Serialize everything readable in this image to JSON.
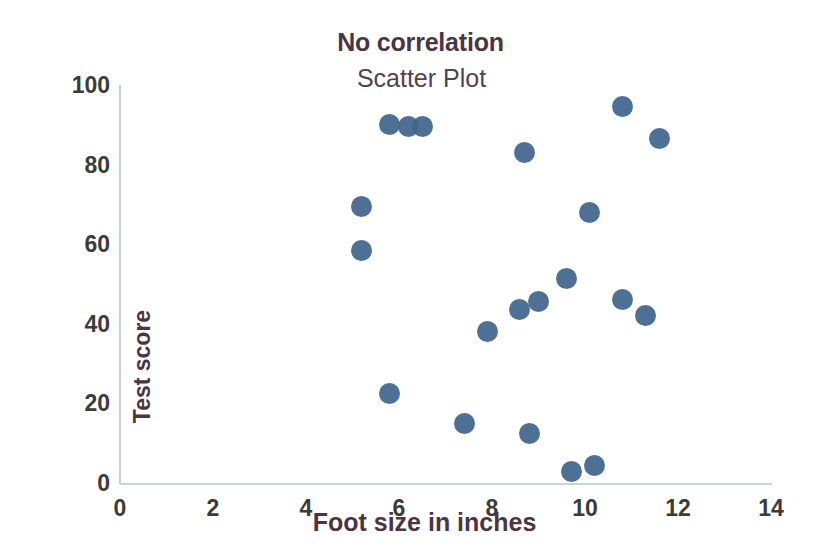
{
  "chart_data": {
    "type": "scatter",
    "title": "No correlation",
    "subtitle": "Scatter Plot",
    "xlabel": "Foot size in inches",
    "ylabel": "Test score",
    "xlim": [
      0,
      14
    ],
    "ylim": [
      0,
      100
    ],
    "xticks": [
      0,
      2,
      4,
      6,
      8,
      10,
      12,
      14
    ],
    "yticks": [
      0,
      20,
      40,
      60,
      80,
      100
    ],
    "grid": false,
    "legend": false,
    "marker_color": "#41658c",
    "title_color": "#4a3544",
    "axis_color": "#c9cdd4",
    "series": [
      {
        "name": "Test score vs foot size",
        "points": [
          {
            "x": 5.2,
            "y": 69.5
          },
          {
            "x": 5.2,
            "y": 58.5
          },
          {
            "x": 5.8,
            "y": 22.5
          },
          {
            "x": 5.8,
            "y": 90.0
          },
          {
            "x": 6.2,
            "y": 89.5
          },
          {
            "x": 6.5,
            "y": 89.5
          },
          {
            "x": 7.4,
            "y": 15.0
          },
          {
            "x": 7.9,
            "y": 38.0
          },
          {
            "x": 8.6,
            "y": 43.5
          },
          {
            "x": 8.7,
            "y": 83.0
          },
          {
            "x": 8.8,
            "y": 12.5
          },
          {
            "x": 9.0,
            "y": 45.5
          },
          {
            "x": 9.6,
            "y": 51.5
          },
          {
            "x": 9.7,
            "y": 3.0
          },
          {
            "x": 10.1,
            "y": 68.0
          },
          {
            "x": 10.2,
            "y": 4.5
          },
          {
            "x": 10.8,
            "y": 94.5
          },
          {
            "x": 10.8,
            "y": 46.0
          },
          {
            "x": 11.3,
            "y": 42.0
          },
          {
            "x": 11.6,
            "y": 86.5
          }
        ]
      }
    ]
  }
}
